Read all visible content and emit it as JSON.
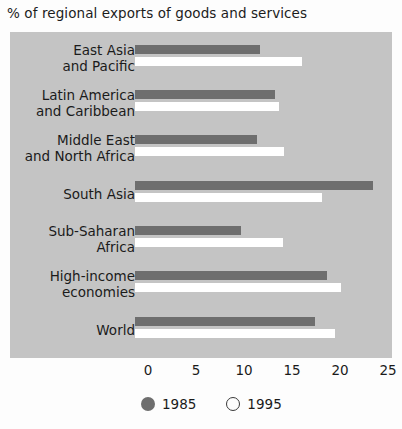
{
  "chart_data": {
    "type": "bar",
    "orientation": "horizontal",
    "title": "% of regional exports of goods and services",
    "xlabel": "",
    "ylabel": "",
    "xlim": [
      0,
      25
    ],
    "xticks": [
      0,
      5,
      10,
      15,
      20,
      25
    ],
    "xtick_labels": [
      "0",
      "5",
      "10",
      "15",
      "20",
      "25"
    ],
    "grid": false,
    "legend_position": "bottom-left",
    "categories": [
      "East Asia and Pacific",
      "Latin America and Caribbean",
      "Middle East and North Africa",
      "South Asia",
      "Sub-Saharan Africa",
      "High-income economies",
      "World"
    ],
    "category_lines": [
      [
        "East Asia",
        "and Pacific"
      ],
      [
        "Latin America",
        "and Caribbean"
      ],
      [
        "Middle East",
        "and North Africa"
      ],
      [
        "South Asia",
        ""
      ],
      [
        "Sub-Saharan",
        "Africa"
      ],
      [
        "High-income",
        "economies"
      ],
      [
        "World",
        ""
      ]
    ],
    "series": [
      {
        "name": "1985",
        "color": "#6e6e6e",
        "values": [
          13.0,
          14.6,
          12.7,
          24.8,
          11.0,
          20.0,
          18.8
        ]
      },
      {
        "name": "1995",
        "color": "#ffffff",
        "values": [
          17.4,
          15.0,
          15.5,
          19.5,
          15.4,
          21.5,
          20.8
        ]
      }
    ],
    "legend": [
      {
        "label": "1985",
        "marker": "filled-circle",
        "color": "#6e6e6e"
      },
      {
        "label": "1995",
        "marker": "open-circle",
        "color": "#ffffff"
      }
    ],
    "plot_background_color": "#c4c4c4",
    "page_background_color": "#fdfdfd"
  }
}
